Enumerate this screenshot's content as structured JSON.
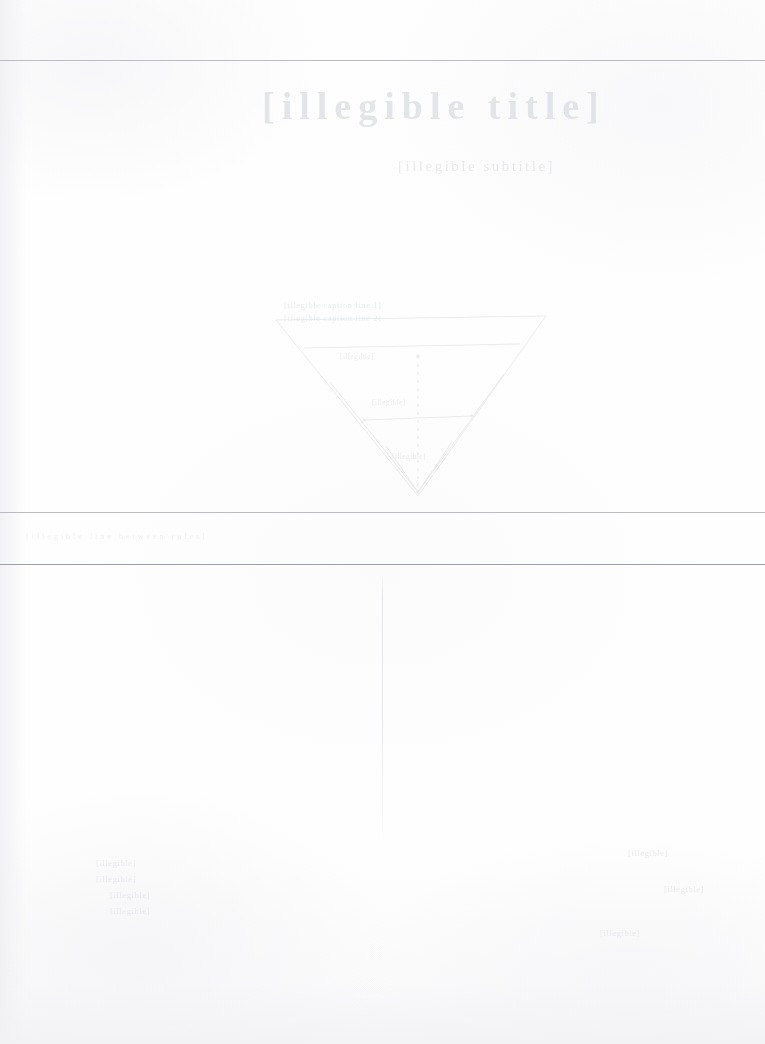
{
  "document": {
    "kind": "faded-scanned-page",
    "condition_note": "Severely bleached scan; nearly all ink lost",
    "background_color": "#fefefe",
    "ink_color": "#d9dbe0",
    "rule_color": "#b9bcc2"
  },
  "header": {
    "title": "[illegible title]",
    "subtitle": "[illegible subtitle]"
  },
  "rules": [
    {
      "name": "top-rule",
      "y": 60,
      "weight": "medium"
    },
    {
      "name": "middle-rule-upper",
      "y": 512,
      "weight": "medium"
    },
    {
      "name": "middle-rule-lower",
      "y": 564,
      "weight": "strong"
    }
  ],
  "figure": {
    "name": "triangular-diagram",
    "caption_lines": [
      "[illegible caption line 1]",
      "[illegible caption line 2]"
    ],
    "interior_labels": [
      "[illegible]",
      "[illegible]",
      "[illegible]"
    ]
  },
  "vertical_divider": {
    "name": "lower-vertical-hairline",
    "x": 382,
    "y_start": 575,
    "y_end": 845
  },
  "band_text": {
    "line": "[illegible line between rules]"
  },
  "footer": {
    "left_block": [
      "[illegible]",
      "[illegible]",
      "[illegible]",
      "[illegible]"
    ],
    "right_block": [
      "[illegible]",
      "[illegible]",
      "[illegible]"
    ]
  }
}
